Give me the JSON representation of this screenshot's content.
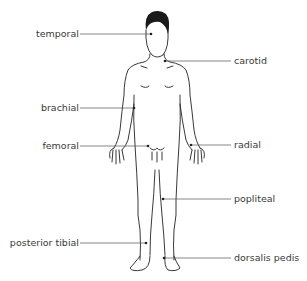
{
  "diagram": {
    "colors": {
      "line": "#555555",
      "outline": "#222222",
      "hair": "#1a1a1a",
      "text": "#3a3a3a"
    },
    "labels": [
      {
        "id": "temporal",
        "text": "temporal",
        "side": "left",
        "y": 34
      },
      {
        "id": "carotid",
        "text": "carotid",
        "side": "right",
        "y": 61
      },
      {
        "id": "brachial",
        "text": "brachial",
        "side": "left",
        "y": 108
      },
      {
        "id": "femoral",
        "text": "femoral",
        "side": "left",
        "y": 146
      },
      {
        "id": "radial",
        "text": "radial",
        "side": "right",
        "y": 145
      },
      {
        "id": "popliteal",
        "text": "popliteal",
        "side": "right",
        "y": 199
      },
      {
        "id": "posterior-tibial",
        "text": "posterior tibial",
        "side": "left",
        "y": 242
      },
      {
        "id": "dorsalis-pedis",
        "text": "dorsalis pedis",
        "side": "right",
        "y": 258
      }
    ]
  }
}
